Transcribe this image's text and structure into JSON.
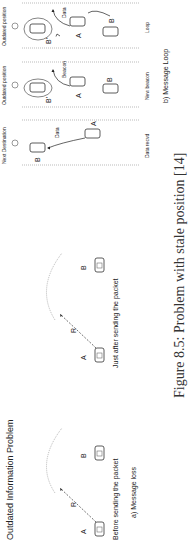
{
  "figure": {
    "title": "Outdated Information Problem",
    "caption": "Figure 8.5: Problem with stale position [14]",
    "panel_a": {
      "label": "a) Message loss",
      "scenes": [
        {
          "caption": "Before sending the packet",
          "nodes": [
            "A",
            "B"
          ],
          "range_label": "R"
        },
        {
          "caption": "Just after sending the packet",
          "nodes": [
            "A",
            "B"
          ],
          "range_label": "R"
        }
      ]
    },
    "panel_b": {
      "label": "b) Message Loop",
      "scenes": [
        {
          "caption": "Data recvd",
          "nodes": [
            "A",
            "B"
          ],
          "arrow_label": "Data",
          "marker_label": "Next Destination"
        },
        {
          "caption": "New beacon",
          "nodes": [
            "A",
            "B",
            "B'"
          ],
          "arrow_label": "Beacon",
          "marker_label": "Outdated position"
        },
        {
          "caption": "Loop",
          "nodes": [
            "A",
            "B",
            "B'"
          ],
          "arrow_label": "Data",
          "marker_label": "Outdated position"
        }
      ]
    }
  }
}
